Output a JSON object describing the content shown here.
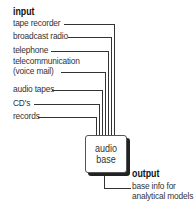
{
  "input": {
    "heading": "input",
    "sources": [
      {
        "label": "tape recorder"
      },
      {
        "label": "broadcast radio"
      },
      {
        "label": "telephone"
      },
      {
        "label": "telecommunication",
        "label2": "(voice mail)"
      },
      {
        "label": "audio tapes"
      },
      {
        "label": "CD's"
      },
      {
        "label": "records"
      }
    ]
  },
  "hub": {
    "line1": "audio",
    "line2": "base"
  },
  "output": {
    "heading": "output",
    "line1": "base info for",
    "line2": "analytical models"
  },
  "colors": {
    "line": "#333333",
    "text": "#333333"
  }
}
